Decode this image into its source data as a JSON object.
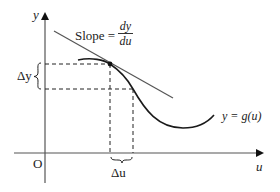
{
  "diagram": {
    "axes": {
      "y_label": "y",
      "x_label": "u",
      "origin_label": "O"
    },
    "slope_label": {
      "prefix": "Slope =",
      "numerator": "dy",
      "denominator": "du"
    },
    "curve_label": "y = g(u)",
    "delta_y_label": "Δy",
    "delta_u_label": "Δu",
    "colors": {
      "curve": "#1a1a1a",
      "tangent": "#555555",
      "axes": "#444444",
      "dashed": "#222222",
      "text": "#222222"
    }
  }
}
